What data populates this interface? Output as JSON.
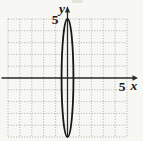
{
  "figure": {
    "background": "#f7f7f3",
    "grid_color": "#9e9e9e",
    "axis_color": "#2a2a2a",
    "curve_color": "#161616",
    "label_color": "#1a1a1a",
    "artifact_color": "#c9c9c2"
  },
  "chart_data": {
    "type": "line",
    "curve": "ellipse",
    "title": "",
    "center": [
      0,
      0
    ],
    "semi_axis_x": 0.5,
    "semi_axis_y": 5,
    "xlabel": "x",
    "ylabel": "y",
    "xlim": [
      -5,
      5
    ],
    "ylim": [
      -5,
      5
    ],
    "grid": "dotted, 1-unit spacing",
    "x_tick": {
      "value": 5,
      "label": "5"
    },
    "y_tick": {
      "value": 5,
      "label": "5"
    }
  }
}
